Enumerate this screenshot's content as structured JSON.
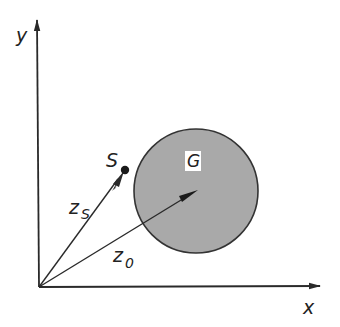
{
  "diagram": {
    "axes": {
      "x_label": "x",
      "y_label": "y",
      "origin": [
        39,
        287
      ],
      "x_end": [
        320,
        286
      ],
      "y_end": [
        37,
        20
      ]
    },
    "region": {
      "label": "G",
      "center": [
        196,
        191
      ],
      "radius": 62,
      "fill": "#a9a9a9",
      "stroke": "#333333"
    },
    "point_s": {
      "label": "S",
      "position": [
        125,
        170
      ]
    },
    "vectors": [
      {
        "name": "z_s",
        "label": "z",
        "subscript": "S",
        "from": [
          39,
          287
        ],
        "to": [
          125,
          170
        ]
      },
      {
        "name": "z_0",
        "label": "z",
        "subscript": "0",
        "from": [
          39,
          287
        ],
        "to": [
          197,
          191
        ]
      }
    ],
    "colors": {
      "line": "#2a2a2a",
      "background": "#ffffff"
    }
  }
}
